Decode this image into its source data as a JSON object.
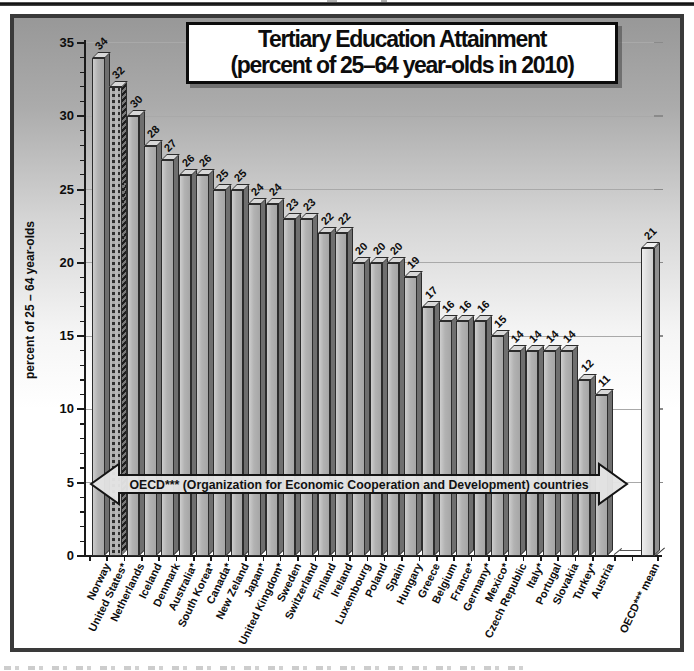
{
  "chart": {
    "title_line1": "Tertiary Education Attainment",
    "title_line2": "(percent of 25–64 year-olds in 2010)",
    "y_axis_label": "percent of 25 – 64 year-olds",
    "oecd_arrow_label": "OECD*** (Organization for Economic Cooperation and Development) countries",
    "colors": {
      "bar_front": "#b2b2b2",
      "bar_side": "#6f6f6f",
      "bar_top": "#d8d8d8",
      "mean_bar_front": "#dddddd",
      "highlight_pattern_dark": "#2f2f2f",
      "gridline": "#a9a9a9",
      "frame": "#3a3a3a",
      "title_text": "#0d0d0d"
    }
  },
  "chart_data": {
    "type": "bar",
    "title": "Tertiary Education Attainment (percent of 25–64 year-olds in 2010)",
    "xlabel": "",
    "ylabel": "percent of 25 – 64 year-olds",
    "ylim": [
      0,
      35
    ],
    "ytick_step": 5,
    "yticks": [
      0,
      5,
      10,
      15,
      20,
      25,
      30,
      35
    ],
    "grid": "horizontal-major",
    "legend": "none",
    "categories": [
      "Norway",
      "United States*",
      "Netherlands",
      "Iceland",
      "Denmark",
      "Australia*",
      "South Korea*",
      "Canada*",
      "New Zeland",
      "Japan*",
      "United Kingdom*",
      "Sweden",
      "Switzerland",
      "Finland",
      "Ireland",
      "Luxembourg",
      "Poland",
      "Spain",
      "Hungary",
      "Greece",
      "Belgium",
      "France*",
      "Germany*",
      "Mexico*",
      "Czech Republic",
      "Italy*",
      "Portugal",
      "Slovakia",
      "Turkey*",
      "Austria",
      "OECD*** mean"
    ],
    "values": [
      34,
      32,
      30,
      28,
      27,
      26,
      26,
      25,
      25,
      24,
      24,
      23,
      23,
      22,
      22,
      20,
      20,
      20,
      19,
      17,
      16,
      16,
      16,
      15,
      14,
      14,
      14,
      14,
      12,
      11,
      21
    ],
    "highlighted_category": "United States*",
    "highlight_style": "dark hatched/checkered bar pattern",
    "last_bar_separated": true,
    "last_bar_label": "OECD*** mean",
    "annotation": "OECD*** (Organization for Economic Cooperation and Development) countries",
    "annotation_type": "double-headed horizontal arrow spanning the 30 OECD-country bars at y=5"
  }
}
